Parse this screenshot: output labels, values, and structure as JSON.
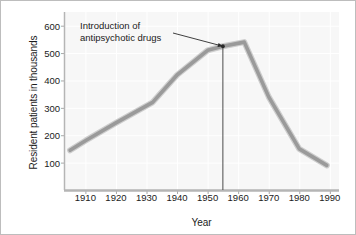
{
  "chart_data": {
    "type": "line",
    "title": "",
    "xlabel": "Year",
    "ylabel": "Resident patients in thousands",
    "xlim": [
      1903,
      1993
    ],
    "ylim": [
      0,
      650
    ],
    "xticks": [
      1910,
      1920,
      1930,
      1940,
      1950,
      1960,
      1970,
      1980,
      1990
    ],
    "xtick_labels": [
      "1910",
      "1920",
      "1930",
      "1940",
      "1950",
      "1960",
      "1970",
      "1980",
      "1990"
    ],
    "yticks": [
      100,
      200,
      300,
      400,
      500,
      600
    ],
    "ytick_labels": [
      "100",
      "200",
      "300",
      "400",
      "500",
      "600"
    ],
    "grid": true,
    "legend": "none",
    "series": [
      {
        "name": "Resident patients",
        "x": [
          1905,
          1910,
          1920,
          1932,
          1940,
          1950,
          1955,
          1962,
          1970,
          1980,
          1989
        ],
        "values": [
          145,
          180,
          245,
          320,
          420,
          510,
          525,
          540,
          340,
          150,
          90
        ]
      }
    ],
    "annotations": [
      {
        "text_line1": "Introduction of",
        "text_line2": "antipsychotic drugs",
        "points_to_x": 1955,
        "points_to_y": 525,
        "has_leader_line": true,
        "has_vertical_drop_line": true
      }
    ],
    "colors": {
      "line": "#9a9a9a",
      "line_shadow": "#c9c9c9",
      "plot_background": "#f7f7f7",
      "grid": "#ffffff",
      "axis": "#a8a8a8",
      "text": "#1b1b1b",
      "frame": "#bdbdbd",
      "annotation_line": "#3a3a3a"
    }
  }
}
